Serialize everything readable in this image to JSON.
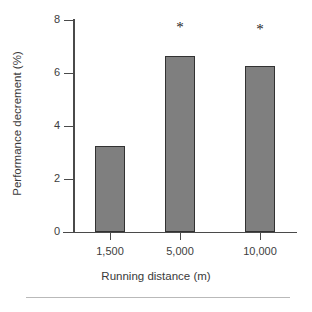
{
  "chart_data": {
    "type": "bar",
    "title": "",
    "xlabel": "Running distance (m)",
    "ylabel": "Performance decrement (%)",
    "categories": [
      "1,500",
      "5,000",
      "10,000"
    ],
    "values": [
      3.25,
      6.65,
      6.25
    ],
    "ylim": [
      0,
      8
    ],
    "yticks": [
      0,
      2,
      4,
      6,
      8
    ],
    "ytick_labels": [
      "0",
      "2",
      "4",
      "6",
      "8"
    ],
    "grid": false,
    "legend": null,
    "annotations": [
      {
        "category": "5,000",
        "text": "*"
      },
      {
        "category": "10,000",
        "text": "*"
      }
    ],
    "bar_fill_color": "#7f7f7f",
    "bar_edge_color": "#323232",
    "axis_color": "#4a4a4a"
  },
  "axes": {
    "y_tick_labels": [
      "8",
      "6",
      "4",
      "2",
      "0"
    ],
    "x_tick_labels": [
      "1,500",
      "5,000",
      "10,000"
    ],
    "x_title": "Running distance (m)",
    "y_title": "Performance decrement (%)"
  },
  "markers": {
    "bar2_significance": "*",
    "bar3_significance": "*"
  },
  "caption": {
    "text": ""
  }
}
